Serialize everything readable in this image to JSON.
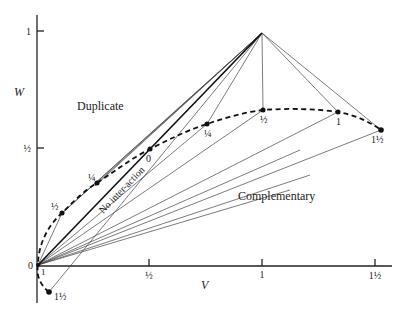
{
  "diagram": {
    "axes": {
      "x_label": "V",
      "y_label": "W",
      "x_ticks": [
        "½",
        "1",
        "1½"
      ],
      "y_ticks": [
        "1",
        "½"
      ],
      "origin_label": "0",
      "origin_side_label": "1"
    },
    "regions": {
      "duplicate": "Duplicate",
      "complementary": "Complementary",
      "no_interaction": "No inter-action"
    },
    "curve_points": [
      {
        "label": "1½",
        "v": 0.05,
        "w": -0.12
      },
      {
        "label": "1",
        "v": 0.0,
        "w": 0.0
      },
      {
        "label": "½",
        "v": 0.11,
        "w": 0.22
      },
      {
        "label": "¼",
        "v": 0.27,
        "w": 0.35
      },
      {
        "label": "0",
        "v": 0.5,
        "w": 0.5
      },
      {
        "label": "¼",
        "v": 0.75,
        "w": 0.6
      },
      {
        "label": "½",
        "v": 1.0,
        "w": 0.66
      },
      {
        "label": "1",
        "v": 1.33,
        "w": 0.65
      },
      {
        "label": "1½",
        "v": 1.52,
        "w": 0.58
      }
    ],
    "apex": {
      "v": 1.0,
      "w": 1.0
    }
  }
}
